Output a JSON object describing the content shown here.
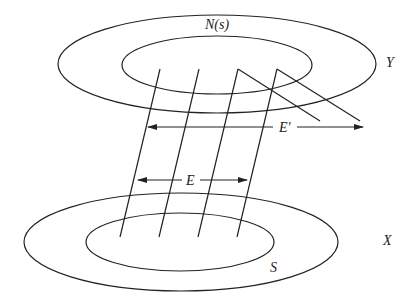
{
  "diagram": {
    "type": "set-mapping-diagram",
    "labels": {
      "top_space": "Y",
      "top_inner_set": "N(s)",
      "bottom_space": "X",
      "bottom_inner_set": "S",
      "lower_arrow": "E",
      "upper_arrow": "E′"
    },
    "top_outer_ellipse": {
      "cx": 217,
      "cy": 64,
      "rx": 159,
      "ry": 49
    },
    "top_inner_ellipse": {
      "cx": 217,
      "cy": 65,
      "rx": 95,
      "ry": 29
    },
    "bottom_outer_ellipse": {
      "cx": 181,
      "cy": 242,
      "rx": 157,
      "ry": 49
    },
    "bottom_inner_ellipse": {
      "cx": 180,
      "cy": 242,
      "rx": 94,
      "ry": 29
    },
    "stroke_color": "#222222",
    "background_color": "#ffffff"
  }
}
